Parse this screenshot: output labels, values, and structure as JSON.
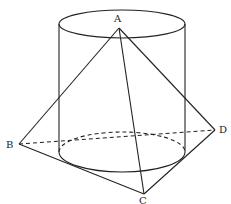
{
  "diagram": {
    "type": "geometry",
    "stroke_color": "#222222",
    "points": {
      "A": {
        "label": "A",
        "x": 119,
        "y": 28
      },
      "B": {
        "label": "B",
        "x": 19,
        "y": 144
      },
      "C": {
        "label": "C",
        "x": 144,
        "y": 194
      },
      "D": {
        "label": "D",
        "x": 215,
        "y": 130
      }
    },
    "cylinder": {
      "cx": 122,
      "top_y": 24,
      "bottom_y": 152,
      "rx": 63,
      "ry_top": 14,
      "ry_bottom": 20
    },
    "edges_solid": [
      "AB",
      "AC",
      "AD",
      "BC",
      "CD"
    ],
    "edges_dashed": [
      "BD"
    ]
  }
}
